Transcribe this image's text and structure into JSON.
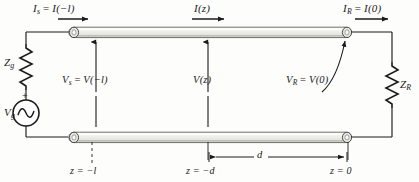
{
  "diagram": {
    "type": "circuit-schematic",
    "colors": {
      "line": "#1b1b1b",
      "conductor_fill": "#efefea",
      "conductor_edge": "#6e6e6e",
      "background": "#fdfdfc",
      "text": "#1b1b1b"
    },
    "labels": {
      "source_current": {
        "main": "I",
        "sub": "s",
        "eq": " = ",
        "expr": "I(−l)"
      },
      "line_current": {
        "main": "I",
        "sub": "",
        "eq": "",
        "expr": "(z)"
      },
      "load_current": {
        "main": "I",
        "sub": "R",
        "eq": " = ",
        "expr": "I(0)"
      },
      "source_voltage": {
        "main": "V",
        "sub": "s",
        "eq": " = ",
        "expr": "V(−l)"
      },
      "line_voltage": {
        "main": "V",
        "sub": "",
        "eq": "",
        "expr": "(z)"
      },
      "load_voltage": {
        "main": "V",
        "sub": "R",
        "eq": " = ",
        "expr": "V(0)"
      },
      "source_impedance": {
        "main": "Z",
        "sub": "g"
      },
      "load_impedance": {
        "main": "Z",
        "sub": "R"
      },
      "source_emf": {
        "main": "V",
        "sub": "g"
      },
      "polarity_plus": "+",
      "polarity_minus": "−",
      "coord_source": "z = −l",
      "coord_d": "z = −d",
      "coord_load": "z = 0",
      "dimension_d": "d"
    }
  }
}
